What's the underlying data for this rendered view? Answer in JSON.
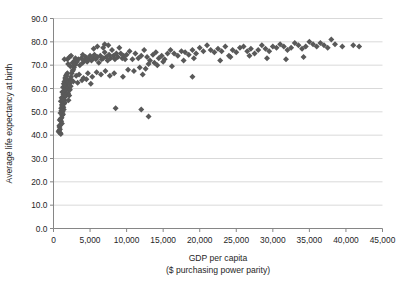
{
  "chart_data": {
    "type": "scatter",
    "title": "",
    "xlabel": "GDP per capita",
    "xlabel_line2": "($ purchasing power parity)",
    "ylabel": "Average life expectancy at birth",
    "xlim": [
      0,
      45000
    ],
    "ylim": [
      0,
      90
    ],
    "xticks": [
      0,
      5000,
      10000,
      15000,
      20000,
      25000,
      30000,
      35000,
      40000,
      45000
    ],
    "xticklabels": [
      "0",
      "5,000",
      "10,000",
      "15,000",
      "20,000",
      "25,000",
      "30,000",
      "35,000",
      "40,000",
      "45,000"
    ],
    "yticks": [
      0,
      10,
      20,
      30,
      40,
      50,
      60,
      70,
      80,
      90
    ],
    "yticklabels": [
      "0.0",
      "10.0",
      "20.0",
      "30.0",
      "40.0",
      "50.0",
      "60.0",
      "70.0",
      "80.0",
      "90.0"
    ],
    "grid": "horizontal",
    "legend": "none",
    "marker": "diamond",
    "marker_color": "#595959",
    "gridline_color": "#d9d9d9",
    "axis_color": "#868686",
    "points": [
      [
        700,
        41.5
      ],
      [
        760,
        42.0
      ],
      [
        820,
        43.5
      ],
      [
        900,
        41.0
      ],
      [
        950,
        44.5
      ],
      [
        1000,
        40.5
      ],
      [
        1050,
        46.0
      ],
      [
        1100,
        47.5
      ],
      [
        1150,
        45.0
      ],
      [
        1200,
        48.5
      ],
      [
        1250,
        50.0
      ],
      [
        1300,
        49.0
      ],
      [
        1350,
        52.0
      ],
      [
        1400,
        51.0
      ],
      [
        1450,
        53.5
      ],
      [
        1500,
        55.0
      ],
      [
        1550,
        54.0
      ],
      [
        1600,
        56.5
      ],
      [
        1650,
        58.0
      ],
      [
        1700,
        57.0
      ],
      [
        1750,
        59.5
      ],
      [
        1800,
        61.0
      ],
      [
        1850,
        60.0
      ],
      [
        1900,
        62.5
      ],
      [
        1950,
        63.5
      ],
      [
        1000,
        54.5
      ],
      [
        1100,
        56.0
      ],
      [
        1200,
        58.5
      ],
      [
        1300,
        60.5
      ],
      [
        1400,
        62.0
      ],
      [
        1500,
        63.0
      ],
      [
        1600,
        64.5
      ],
      [
        1700,
        65.5
      ],
      [
        1800,
        66.0
      ],
      [
        1900,
        66.5
      ],
      [
        850,
        46.5
      ],
      [
        950,
        49.5
      ],
      [
        1050,
        51.5
      ],
      [
        1150,
        53.0
      ],
      [
        1250,
        55.5
      ],
      [
        1350,
        57.5
      ],
      [
        1450,
        59.0
      ],
      [
        1550,
        61.5
      ],
      [
        1650,
        64.0
      ],
      [
        1750,
        65.0
      ],
      [
        800,
        44.0
      ],
      [
        880,
        42.5
      ],
      [
        980,
        47.0
      ],
      [
        1080,
        50.5
      ],
      [
        1180,
        52.5
      ],
      [
        2000,
        58.0
      ],
      [
        2100,
        60.0
      ],
      [
        2200,
        62.0
      ],
      [
        2300,
        64.0
      ],
      [
        2400,
        65.0
      ],
      [
        2500,
        66.5
      ],
      [
        2600,
        67.5
      ],
      [
        2700,
        68.0
      ],
      [
        2800,
        69.0
      ],
      [
        2900,
        70.0
      ],
      [
        2050,
        55.0
      ],
      [
        2150,
        57.0
      ],
      [
        2250,
        59.5
      ],
      [
        2350,
        61.0
      ],
      [
        2450,
        63.5
      ],
      [
        1900,
        72.5
      ],
      [
        2000,
        70.5
      ],
      [
        2300,
        69.5
      ],
      [
        2600,
        71.0
      ],
      [
        2900,
        72.0
      ],
      [
        3000,
        70.5
      ],
      [
        3200,
        71.5
      ],
      [
        3400,
        72.5
      ],
      [
        3600,
        70.0
      ],
      [
        3800,
        73.0
      ],
      [
        4000,
        71.0
      ],
      [
        4200,
        72.0
      ],
      [
        4400,
        73.5
      ],
      [
        4600,
        71.5
      ],
      [
        4800,
        72.5
      ],
      [
        5000,
        74.0
      ],
      [
        5200,
        72.0
      ],
      [
        5400,
        73.0
      ],
      [
        5600,
        74.5
      ],
      [
        5800,
        72.5
      ],
      [
        6000,
        73.5
      ],
      [
        6200,
        71.0
      ],
      [
        6400,
        74.0
      ],
      [
        6600,
        72.5
      ],
      [
        6800,
        73.0
      ],
      [
        7000,
        75.5
      ],
      [
        7200,
        73.5
      ],
      [
        7400,
        72.0
      ],
      [
        7600,
        74.5
      ],
      [
        7800,
        73.0
      ],
      [
        8000,
        76.5
      ],
      [
        8200,
        74.0
      ],
      [
        8400,
        72.5
      ],
      [
        8600,
        75.0
      ],
      [
        8800,
        73.5
      ],
      [
        9000,
        77.5
      ],
      [
        9200,
        75.0
      ],
      [
        9400,
        73.0
      ],
      [
        9600,
        74.0
      ],
      [
        9800,
        72.5
      ],
      [
        3100,
        65.5
      ],
      [
        3500,
        66.0
      ],
      [
        4100,
        64.5
      ],
      [
        4700,
        66.5
      ],
      [
        5300,
        65.0
      ],
      [
        5900,
        67.0
      ],
      [
        6500,
        66.0
      ],
      [
        7100,
        67.5
      ],
      [
        7700,
        65.5
      ],
      [
        8300,
        66.5
      ],
      [
        2700,
        63.0
      ],
      [
        3300,
        62.5
      ],
      [
        3900,
        63.5
      ],
      [
        4500,
        64.0
      ],
      [
        5100,
        62.0
      ],
      [
        10000,
        74.5
      ],
      [
        10400,
        76.0
      ],
      [
        10800,
        72.5
      ],
      [
        11200,
        75.0
      ],
      [
        11600,
        73.0
      ],
      [
        12000,
        74.0
      ],
      [
        12400,
        76.5
      ],
      [
        12800,
        73.5
      ],
      [
        13200,
        72.0
      ],
      [
        13600,
        74.5
      ],
      [
        14000,
        75.5
      ],
      [
        14400,
        73.0
      ],
      [
        14800,
        74.0
      ],
      [
        15200,
        72.5
      ],
      [
        15600,
        75.0
      ],
      [
        10200,
        68.0
      ],
      [
        11000,
        67.5
      ],
      [
        12200,
        66.0
      ],
      [
        13000,
        70.5
      ],
      [
        13800,
        71.0
      ],
      [
        9500,
        65.0
      ],
      [
        11800,
        69.0
      ],
      [
        12600,
        68.5
      ],
      [
        14200,
        70.0
      ],
      [
        15000,
        71.5
      ],
      [
        16000,
        76.5
      ],
      [
        16500,
        75.0
      ],
      [
        17000,
        74.0
      ],
      [
        17500,
        76.0
      ],
      [
        18000,
        75.5
      ],
      [
        18500,
        74.5
      ],
      [
        19000,
        76.5
      ],
      [
        19500,
        75.0
      ],
      [
        20000,
        77.5
      ],
      [
        20500,
        76.0
      ],
      [
        21000,
        78.5
      ],
      [
        21500,
        76.5
      ],
      [
        22000,
        75.5
      ],
      [
        22500,
        77.0
      ],
      [
        23000,
        76.0
      ],
      [
        23500,
        78.0
      ],
      [
        24000,
        74.0
      ],
      [
        24500,
        76.5
      ],
      [
        25000,
        75.5
      ],
      [
        25500,
        77.5
      ],
      [
        26000,
        78.0
      ],
      [
        26500,
        76.0
      ],
      [
        27000,
        77.0
      ],
      [
        27500,
        75.0
      ],
      [
        28000,
        76.5
      ],
      [
        28500,
        78.5
      ],
      [
        29000,
        77.0
      ],
      [
        29500,
        76.0
      ],
      [
        30000,
        78.0
      ],
      [
        30500,
        77.5
      ],
      [
        31000,
        79.0
      ],
      [
        31500,
        78.0
      ],
      [
        32000,
        76.5
      ],
      [
        32500,
        77.5
      ],
      [
        33000,
        79.5
      ],
      [
        33500,
        78.5
      ],
      [
        34000,
        77.0
      ],
      [
        34500,
        78.0
      ],
      [
        35000,
        80.0
      ],
      [
        35500,
        79.0
      ],
      [
        36000,
        78.0
      ],
      [
        36500,
        79.5
      ],
      [
        37000,
        78.5
      ],
      [
        37500,
        77.5
      ],
      [
        38000,
        81.0
      ],
      [
        38500,
        79.0
      ],
      [
        39500,
        78.0
      ],
      [
        41000,
        78.5
      ],
      [
        41800,
        78.0
      ],
      [
        16200,
        69.5
      ],
      [
        17800,
        72.0
      ],
      [
        19200,
        73.0
      ],
      [
        22800,
        72.0
      ],
      [
        24200,
        73.5
      ],
      [
        26800,
        74.0
      ],
      [
        29200,
        73.0
      ],
      [
        31800,
        72.5
      ],
      [
        34200,
        73.5
      ],
      [
        8500,
        51.5
      ],
      [
        12000,
        51.0
      ],
      [
        13000,
        48.0
      ],
      [
        19000,
        65.0
      ],
      [
        3000,
        73.0
      ],
      [
        4000,
        74.5
      ],
      [
        5500,
        77.0
      ],
      [
        6000,
        78.0
      ],
      [
        7000,
        79.0
      ],
      [
        1500,
        72.5
      ],
      [
        2200,
        73.5
      ],
      [
        2400,
        74.0
      ],
      [
        6800,
        77.5
      ],
      [
        7500,
        78.5
      ]
    ]
  }
}
